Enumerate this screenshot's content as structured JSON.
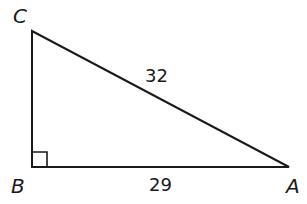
{
  "figure": {
    "type": "right-triangle",
    "stroke_color": "#1a1a1a",
    "vertices": {
      "C": {
        "label": "C",
        "x": 32,
        "y": 31
      },
      "B": {
        "label": "B",
        "x": 32,
        "y": 167
      },
      "A": {
        "label": "A",
        "x": 289,
        "y": 167
      }
    },
    "right_angle_at": "B",
    "sides": {
      "hypotenuse_CA": {
        "label": "32"
      },
      "base_BA": {
        "label": "29"
      }
    }
  }
}
